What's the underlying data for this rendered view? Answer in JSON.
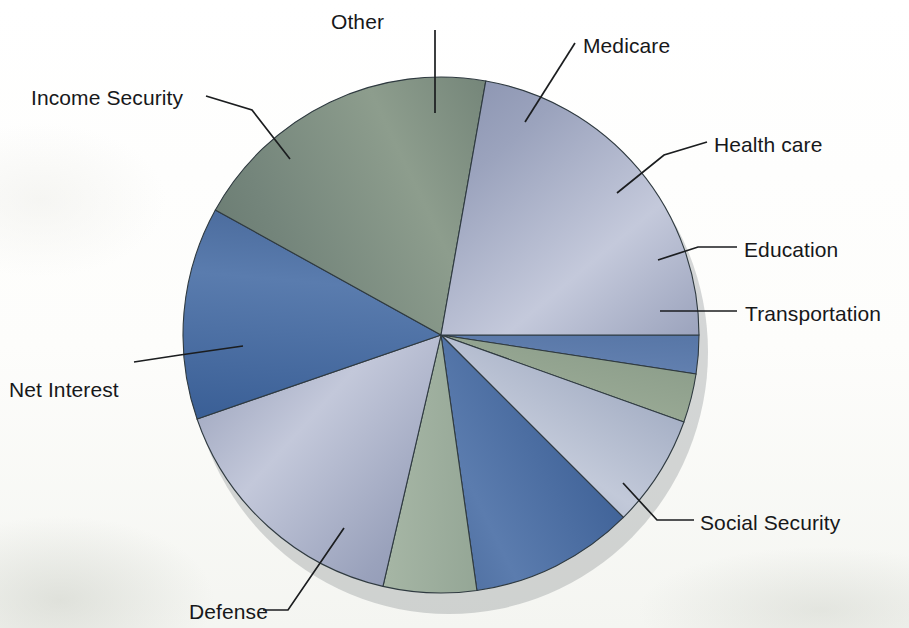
{
  "figure": {
    "background_color": "#fdfdfc",
    "label_color": "#17181a",
    "leader_line_color": "#1b1d1f"
  },
  "chart_data": {
    "type": "pie",
    "title": "",
    "subtitle": "",
    "xlabel": "",
    "ylabel": "",
    "legend_position": "none",
    "grid": false,
    "label_placement": "outside-with-leader-lines",
    "start_angle_deg": 0,
    "direction": "clockwise",
    "units": "percent of total federal budget outlays",
    "center_px": [
      441,
      335
    ],
    "radius_px": 258,
    "categories": [
      "Transportation",
      "Education",
      "Health care",
      "Medicare",
      "Other",
      "Income Security",
      "Net Interest",
      "Defense",
      "Social Security"
    ],
    "values": [
      2.5,
      3.0,
      7.0,
      10.3,
      5.8,
      16.1,
      13.3,
      19.7,
      22.3
    ],
    "slices": [
      {
        "label": "Transportation",
        "value": 2.5,
        "start_deg": 0.0,
        "end_deg": 8.7,
        "color": "#3f6193",
        "color_light": "#6885b4",
        "color_dark": "#32527f"
      },
      {
        "label": "Education",
        "value": 3.0,
        "start_deg": 8.7,
        "end_deg": 19.7,
        "color": "#7e9180",
        "color_light": "#9bab96",
        "color_dark": "#63795f"
      },
      {
        "label": "Health care",
        "value": 7.0,
        "start_deg": 19.7,
        "end_deg": 45.0,
        "color": "#9aa5bd",
        "color_light": "#c2c9d9",
        "color_dark": "#7e8ba6"
      },
      {
        "label": "Medicare",
        "value": 10.3,
        "start_deg": 45.0,
        "end_deg": 82.0,
        "color": "#3d6096",
        "color_light": "#5b7cae",
        "color_dark": "#2c4a7a"
      },
      {
        "label": "Other",
        "value": 5.8,
        "start_deg": 82.0,
        "end_deg": 103.0,
        "color": "#8a9d8d",
        "color_light": "#a5b5a4",
        "color_dark": "#6f8374"
      },
      {
        "label": "Income Security",
        "value": 16.1,
        "start_deg": 103.0,
        "end_deg": 161.0,
        "color": "#9aa2bc",
        "color_light": "#c3c8da",
        "color_dark": "#7b85a4"
      },
      {
        "label": "Net Interest",
        "value": 13.3,
        "start_deg": 161.0,
        "end_deg": 209.0,
        "color": "#3a5f96",
        "color_light": "#5a7cae",
        "color_dark": "#2b4878"
      },
      {
        "label": "Defense",
        "value": 19.7,
        "start_deg": 209.0,
        "end_deg": 280.0,
        "color": "#74857b",
        "color_light": "#8d9d8d",
        "color_dark": "#5d6f66"
      },
      {
        "label": "Social Security",
        "value": 22.3,
        "start_deg": 280.0,
        "end_deg": 360.0,
        "color": "#9ba3bd",
        "color_light": "#c4c9db",
        "color_dark": "#7d87a6"
      }
    ]
  },
  "labels": [
    {
      "id": "other",
      "text": "Other",
      "x": 331,
      "y": 10,
      "anchor": "start"
    },
    {
      "id": "medicare",
      "text": "Medicare",
      "x": 583,
      "y": 34,
      "anchor": "start"
    },
    {
      "id": "income-security",
      "text": "Income Security",
      "x": 31,
      "y": 86,
      "anchor": "start"
    },
    {
      "id": "health-care",
      "text": "Health care",
      "x": 714,
      "y": 133,
      "anchor": "start"
    },
    {
      "id": "education",
      "text": "Education",
      "x": 744,
      "y": 238,
      "anchor": "start"
    },
    {
      "id": "transportation",
      "text": "Transportation",
      "x": 745,
      "y": 302,
      "anchor": "start"
    },
    {
      "id": "net-interest",
      "text": "Net Interest",
      "x": 9,
      "y": 378,
      "anchor": "start"
    },
    {
      "id": "social-security",
      "text": "Social Security",
      "x": 700,
      "y": 511,
      "anchor": "start"
    },
    {
      "id": "defense",
      "text": "Defense",
      "x": 189,
      "y": 600,
      "anchor": "start"
    }
  ],
  "leaders": [
    {
      "id": "other-leader",
      "points": "435,30 435,113"
    },
    {
      "id": "medicare-leader",
      "points": "575,43 525,122"
    },
    {
      "id": "income-security-leader",
      "points": "206,96 252,110 290,159"
    },
    {
      "id": "health-care-leader",
      "points": "707,142 664,155 617,193"
    },
    {
      "id": "education-leader",
      "points": "737,247 698,247 658,260"
    },
    {
      "id": "transportation-leader",
      "points": "737,311 660,311"
    },
    {
      "id": "net-interest-leader",
      "points": "134,362 180,355 243,346"
    },
    {
      "id": "social-security-leader",
      "points": "694,520 657,520 623,483"
    },
    {
      "id": "defense-leader",
      "points": "263,610 288,610 344,528"
    }
  ]
}
